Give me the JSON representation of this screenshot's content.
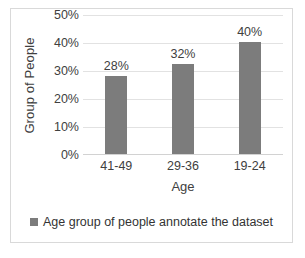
{
  "chart_data": {
    "type": "bar",
    "title": "",
    "subtitle": "",
    "xlabel": "Age",
    "ylabel": "Group of People",
    "categories": [
      "41-49",
      "29-36",
      "19-24"
    ],
    "values": [
      28,
      32,
      40
    ],
    "data_labels": [
      "28%",
      "32%",
      "40%"
    ],
    "ylim": [
      0,
      50
    ],
    "ytick_values": [
      0,
      10,
      20,
      30,
      40,
      50
    ],
    "ytick_labels": [
      "0%",
      "10%",
      "20%",
      "30%",
      "40%",
      "50%"
    ],
    "grid": true,
    "legend_position": "bottom",
    "series": [
      {
        "name": "Age group of people annotate the dataset",
        "values": [
          28,
          32,
          40
        ],
        "color": "#7c7c7c"
      }
    ],
    "colors": {
      "bar": "#7c7c7c",
      "gridline": "#e2e2e2",
      "border": "#d9d9d9",
      "text": "#404040",
      "background": "#ffffff"
    }
  },
  "legend": {
    "entries": [
      {
        "label": "Age group of people annotate the dataset",
        "swatch": "legend-swatch-gray"
      }
    ]
  }
}
